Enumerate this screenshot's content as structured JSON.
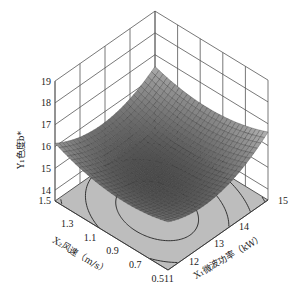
{
  "chart_data": {
    "type": "surface3d",
    "title": "",
    "xlabel": "X₁微波功率（kW）",
    "ylabel": "X₂风速（m/s）",
    "zlabel": "Y₁色度b*",
    "x_ticks": [
      "11",
      "12",
      "13",
      "14",
      "15"
    ],
    "y_ticks": [
      "0.5",
      "0.7",
      "0.9",
      "1.1",
      "1.3",
      "1.5"
    ],
    "z_ticks": [
      "14",
      "15",
      "16",
      "17",
      "18",
      "19"
    ],
    "xlim": [
      11,
      15
    ],
    "ylim": [
      0.5,
      1.5
    ],
    "zlim": [
      13.5,
      19
    ],
    "surface": {
      "description": "Bowl-shaped response surface (minimum near center), with contour projection on base",
      "corner_values": {
        "x11_y1.5": 16.0,
        "x15_y1.5": 16.7,
        "x11_y0.5": 15.6,
        "x15_y0.5": 16.4
      },
      "min_approx": {
        "x": 12.6,
        "y": 0.95,
        "z": 14.9
      }
    },
    "contours_on_base": true,
    "grid": true
  },
  "labels": {
    "z_axis": "Y₁色度b*",
    "y_axis": "X₂风速（m/s）",
    "x_axis": "X₁微波功率（kW）"
  },
  "colors": {
    "surface_light": "#b4b4b4",
    "surface_dark": "#4a4a4a",
    "base": "#bdbdbd",
    "grid": "#555555"
  }
}
